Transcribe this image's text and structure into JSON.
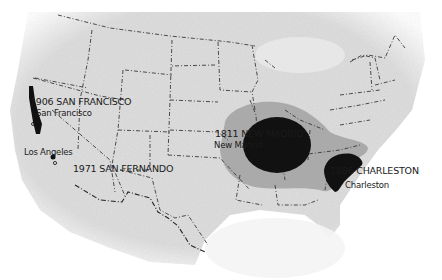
{
  "map": {
    "subject": "Historical US earthquakes",
    "colors": {
      "land": "#dcdcdc",
      "border": "#3a3a3a",
      "felt_zone": "#a8a8a8",
      "damage_zone": "#111111",
      "background": "#ffffff"
    },
    "earthquakes": [
      {
        "id": "sf",
        "label": "1906 SAN FRANCISCO",
        "city": "San Francisco"
      },
      {
        "id": "sfer",
        "label": "1971  SAN FERNANDO",
        "city": "Los Angeles"
      },
      {
        "id": "nm",
        "label": "1811 NEW MADRID",
        "city": "New Madrid"
      },
      {
        "id": "ch",
        "label": "1886 CHARLESTON",
        "city": "Charleston"
      }
    ]
  }
}
